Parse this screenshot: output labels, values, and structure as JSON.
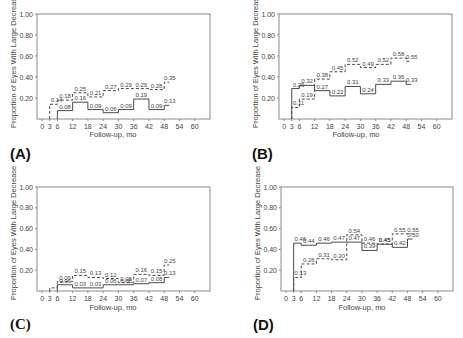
{
  "figure": {
    "axis_style": {
      "frame_color": "#8a8a8a",
      "line_color": "#4a4a4a",
      "text_color": "#444444"
    }
  },
  "chart_data": [
    {
      "panel": "(A)",
      "type": "line",
      "step": true,
      "title": "",
      "xlabel": "Follow-up, mo",
      "ylabel": "Proportion of Eyes With Large Decrease",
      "xticks": [
        0,
        3,
        6,
        12,
        18,
        24,
        30,
        36,
        42,
        48,
        54,
        60
      ],
      "yticks": [
        "0.20",
        "0.40",
        "0.60",
        "0.80",
        "1.00"
      ],
      "ylim": [
        0,
        1
      ],
      "xlim": [
        -2,
        66
      ],
      "grid": false,
      "series": [
        {
          "name": "dashed",
          "style": "dashed",
          "segments": [
            [
              3,
              6,
              0.14
            ],
            [
              6,
              12,
              0.18
            ],
            [
              12,
              18,
              0.25
            ],
            [
              18,
              24,
              0.21
            ],
            [
              24,
              30,
              0.27
            ],
            [
              30,
              36,
              0.29
            ],
            [
              36,
              42,
              0.29
            ],
            [
              42,
              48,
              0.28
            ],
            [
              48,
              50,
              0.35
            ]
          ],
          "labels": [
            "0.14",
            "0.18",
            "0.25",
            "0.21",
            "0.27",
            "0.29",
            "0.29",
            "0.28",
            "0.35"
          ]
        },
        {
          "name": "solid",
          "style": "solid",
          "segments": [
            [
              6,
              12,
              0.08
            ],
            [
              12,
              18,
              0.16
            ],
            [
              18,
              24,
              0.09
            ],
            [
              24,
              30,
              0.06
            ],
            [
              30,
              36,
              0.09
            ],
            [
              36,
              42,
              0.19
            ],
            [
              42,
              48,
              0.09
            ],
            [
              48,
              50,
              0.13
            ]
          ],
          "labels": [
            "0.08",
            "0.16",
            "0.09",
            "0.06",
            "0.09",
            "0.19",
            "0.09",
            "0.13"
          ]
        }
      ]
    },
    {
      "panel": "(B)",
      "type": "line",
      "step": true,
      "title": "",
      "xlabel": "Follow-up, mo",
      "ylabel": "Proportion of Eyes With Large Decrease",
      "xticks": [
        0,
        3,
        6,
        12,
        18,
        24,
        30,
        36,
        42,
        48,
        54,
        60
      ],
      "yticks": [
        "0.20",
        "0.40",
        "0.60",
        "0.80",
        "1.00"
      ],
      "ylim": [
        0,
        1
      ],
      "xlim": [
        -2,
        66
      ],
      "grid": false,
      "series": [
        {
          "name": "dashed",
          "style": "dashed",
          "segments": [
            [
              3,
              6,
              0.11
            ],
            [
              6,
              12,
              0.19
            ],
            [
              12,
              18,
              0.38
            ],
            [
              18,
              24,
              0.45
            ],
            [
              24,
              30,
              0.52
            ],
            [
              30,
              36,
              0.49
            ],
            [
              36,
              42,
              0.52
            ],
            [
              42,
              48,
              0.58
            ],
            [
              48,
              50,
              0.55
            ]
          ],
          "labels": [
            "0.11",
            "0.19",
            "0.38",
            "0.45",
            "0.52",
            "0.49",
            "0.52",
            "0.58",
            "0.55"
          ]
        },
        {
          "name": "solid",
          "style": "solid",
          "segments": [
            [
              3,
              6,
              0.29
            ],
            [
              6,
              12,
              0.32
            ],
            [
              12,
              18,
              0.27
            ],
            [
              18,
              24,
              0.22
            ],
            [
              24,
              30,
              0.31
            ],
            [
              30,
              36,
              0.24
            ],
            [
              36,
              42,
              0.33
            ],
            [
              42,
              48,
              0.36
            ],
            [
              48,
              50,
              0.33
            ]
          ],
          "labels": [
            "0.29",
            "0.32",
            "0.27",
            "0.22",
            "0.31",
            "0.24",
            "0.33",
            "0.36",
            "0.33"
          ]
        }
      ]
    },
    {
      "panel": "(C)",
      "type": "line",
      "step": true,
      "title": "",
      "xlabel": "Follow-up, mo",
      "ylabel": "Proportion of Eyes With Large Decrease",
      "xticks": [
        0,
        3,
        6,
        12,
        18,
        24,
        30,
        36,
        42,
        48,
        54,
        60
      ],
      "yticks": [
        "0.20",
        "0.40",
        "0.60",
        "0.80",
        "1.00"
      ],
      "ylim": [
        0,
        1
      ],
      "xlim": [
        -2,
        66
      ],
      "grid": false,
      "series": [
        {
          "name": "dashed",
          "style": "dashed",
          "segments": [
            [
              3,
              6,
              0.03
            ],
            [
              6,
              12,
              0.09
            ],
            [
              12,
              18,
              0.15
            ],
            [
              18,
              24,
              0.13
            ],
            [
              24,
              30,
              0.12
            ],
            [
              30,
              36,
              0.08
            ],
            [
              36,
              42,
              0.16
            ],
            [
              42,
              48,
              0.15
            ],
            [
              48,
              50,
              0.25
            ]
          ],
          "labels": [
            "",
            "0.09",
            "0.15",
            "0.13",
            "0.12",
            "0.08",
            "0.16",
            "0.15",
            "0.25"
          ]
        },
        {
          "name": "solid",
          "style": "solid",
          "segments": [
            [
              6,
              12,
              0.06
            ],
            [
              12,
              18,
              0.03
            ],
            [
              18,
              24,
              0.03
            ],
            [
              24,
              30,
              0.06
            ],
            [
              30,
              36,
              0.06
            ],
            [
              36,
              42,
              0.07
            ],
            [
              42,
              48,
              0.08
            ],
            [
              48,
              50,
              0.13
            ]
          ],
          "labels": [
            "0.06",
            "0.03",
            "0.03",
            "0.06",
            "0.06",
            "0.07",
            "0.08",
            "0.13"
          ]
        }
      ]
    },
    {
      "panel": "(D)",
      "type": "line",
      "step": true,
      "title": "",
      "xlabel": "Follow-up, mo",
      "ylabel": "Proportion of Eyes With Large Decrease",
      "xticks": [
        0,
        3,
        6,
        12,
        18,
        24,
        30,
        36,
        42,
        48,
        54,
        60
      ],
      "yticks": [
        "0.20",
        "0.40",
        "0.60",
        "0.80",
        "1.00"
      ],
      "ylim": [
        0,
        1
      ],
      "xlim": [
        -2,
        66
      ],
      "grid": false,
      "series": [
        {
          "name": "dashed",
          "style": "dashed",
          "segments": [
            [
              3,
              6,
              0.13
            ],
            [
              6,
              12,
              0.26
            ],
            [
              12,
              18,
              0.31
            ],
            [
              18,
              24,
              0.3
            ],
            [
              24,
              30,
              0.54
            ],
            [
              30,
              36,
              0.46
            ],
            [
              36,
              42,
              0.45
            ],
            [
              42,
              48,
              0.55
            ],
            [
              48,
              50,
              0.55
            ]
          ],
          "labels": [
            "0.13",
            "0.26",
            "0.31",
            "0.30",
            "0.54",
            "0.46",
            "0.45",
            "0.55",
            "0.55"
          ]
        },
        {
          "name": "solid",
          "style": "solid",
          "segments": [
            [
              3,
              6,
              0.46
            ],
            [
              6,
              12,
              0.44
            ],
            [
              12,
              18,
              0.46
            ],
            [
              18,
              24,
              0.47
            ],
            [
              24,
              30,
              0.47
            ],
            [
              30,
              36,
              0.39
            ],
            [
              36,
              42,
              0.45
            ],
            [
              42,
              48,
              0.42
            ],
            [
              48,
              50,
              0.5
            ]
          ],
          "labels": [
            "0.46",
            "0.44",
            "0.46",
            "0.47",
            "0.47",
            "0.39",
            "0.45",
            "0.42",
            "0.50"
          ]
        }
      ]
    }
  ]
}
